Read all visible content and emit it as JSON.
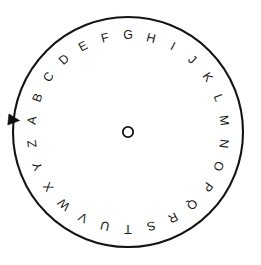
{
  "figure": {
    "name": "alphabet-spinner-wheel",
    "type": "spinner",
    "background_color": "#ffffff"
  },
  "wheel": {
    "center_x": 128,
    "center_y": 132,
    "radius": 115,
    "sector_count": 26,
    "sector_angle_degrees": 13.846,
    "start_angle_degrees": -180,
    "rim_color": "#141414",
    "rim_width": 2.1,
    "spoke_color": "#5a5a5a",
    "spoke_width": 0.9,
    "sector_fill": "#ffffff",
    "letter_color": "#1a1a1a",
    "letter_radius": 96,
    "sectors": [
      {
        "label": "A"
      },
      {
        "label": "B"
      },
      {
        "label": "C"
      },
      {
        "label": "D"
      },
      {
        "label": "E"
      },
      {
        "label": "F"
      },
      {
        "label": "G"
      },
      {
        "label": "H"
      },
      {
        "label": "I"
      },
      {
        "label": "J"
      },
      {
        "label": "K"
      },
      {
        "label": "L"
      },
      {
        "label": "M"
      },
      {
        "label": "N"
      },
      {
        "label": "O"
      },
      {
        "label": "P"
      },
      {
        "label": "Q"
      },
      {
        "label": "R"
      },
      {
        "label": "S"
      },
      {
        "label": "T"
      },
      {
        "label": "U"
      },
      {
        "label": "V"
      },
      {
        "label": "W"
      },
      {
        "label": "X"
      },
      {
        "label": "Y"
      },
      {
        "label": "Z"
      }
    ]
  },
  "hub": {
    "radius": 5.2,
    "fill": "#ffffff",
    "stroke": "#141414"
  },
  "pointer": {
    "label": "pointer",
    "angle_degrees": 186,
    "color": "#111111",
    "size": 7
  }
}
